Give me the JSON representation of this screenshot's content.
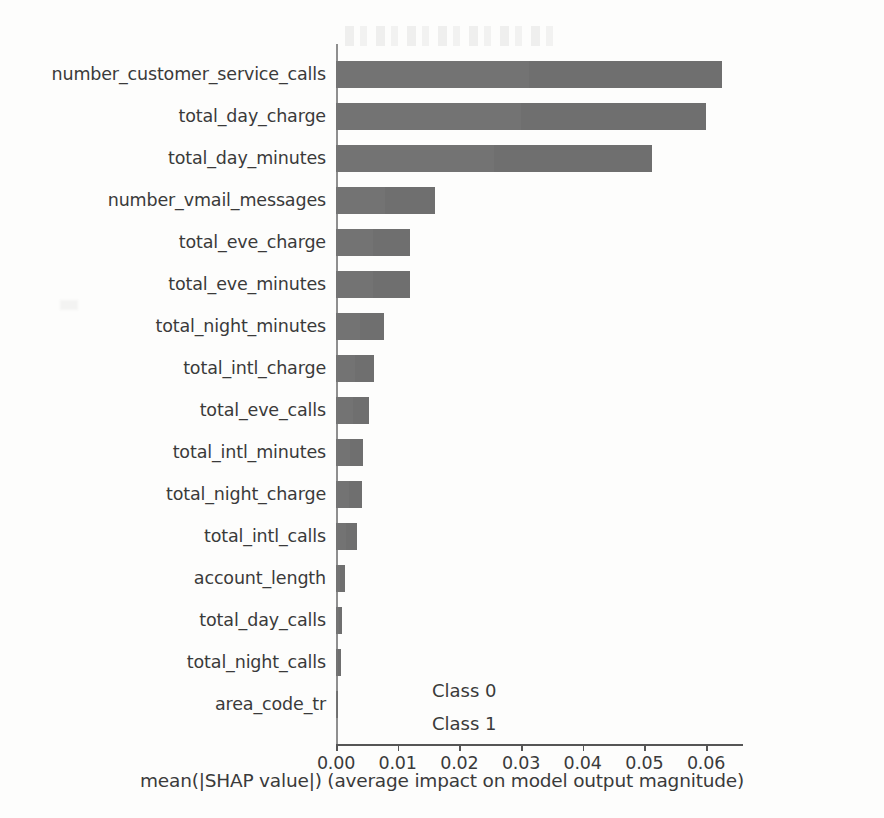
{
  "chart_data": {
    "type": "bar",
    "orientation": "horizontal",
    "stacked": true,
    "title": "",
    "xlabel": "mean(|SHAP value|) (average impact on model output magnitude)",
    "ylabel": "",
    "xlim": [
      0.0,
      0.066
    ],
    "xticks": [
      "0.00",
      "0.01",
      "0.02",
      "0.03",
      "0.04",
      "0.05",
      "0.06"
    ],
    "xtickvalues": [
      0.0,
      0.01,
      0.02,
      0.03,
      0.04,
      0.05,
      0.06
    ],
    "grid": false,
    "legend_position": "center-left",
    "categories": [
      "number_customer_service_calls",
      "total_day_charge",
      "total_day_minutes",
      "number_vmail_messages",
      "total_eve_charge",
      "total_eve_minutes",
      "total_night_minutes",
      "total_intl_charge",
      "total_eve_calls",
      "total_intl_minutes",
      "total_night_charge",
      "total_intl_calls",
      "account_length",
      "total_day_calls",
      "total_night_calls",
      "area_code_tr"
    ],
    "series": [
      {
        "name": "Class 0",
        "color": "#737373",
        "values": [
          0.0313,
          0.03,
          0.0256,
          0.008,
          0.006,
          0.006,
          0.0039,
          0.0031,
          0.0027,
          0.0022,
          0.0021,
          0.0017,
          0.0007,
          0.0005,
          0.0004,
          0.0001
        ]
      },
      {
        "name": "Class 1",
        "color": "#6f6f6f",
        "values": [
          0.0313,
          0.03,
          0.0256,
          0.008,
          0.006,
          0.006,
          0.0039,
          0.0031,
          0.0027,
          0.0022,
          0.0021,
          0.0017,
          0.0007,
          0.0005,
          0.0004,
          0.0001
        ]
      }
    ],
    "totals": [
      0.0626,
      0.06,
      0.0512,
      0.016,
      0.012,
      0.012,
      0.0078,
      0.0062,
      0.0054,
      0.0044,
      0.0042,
      0.0034,
      0.0014,
      0.001,
      0.0008,
      0.0002
    ]
  },
  "legend": {
    "items": [
      {
        "label": "Class 0"
      },
      {
        "label": "Class 1"
      }
    ]
  }
}
